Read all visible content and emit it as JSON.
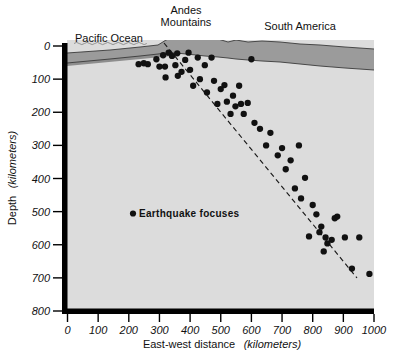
{
  "figure": {
    "title_labels": {
      "pacific_ocean": "Pacific Ocean",
      "andes_line1": "Andes",
      "andes_line2": "Mountains",
      "south_america": "South America"
    },
    "legend": {
      "marker": "earthquake-focus-dot",
      "label": "Earthquake  focuses"
    },
    "colors": {
      "mantle": "#dcdcdc",
      "crust": "#9b9b9b",
      "slab": "#8d8d8d",
      "axis": "#000000",
      "dot": "#111111",
      "page": "#ffffff"
    }
  },
  "chart_data": {
    "type": "scatter",
    "title": "",
    "xlabel_plain": "East-west distance",
    "xlabel_units": "(kilometers)",
    "ylabel_plain": "Depth",
    "ylabel_units": "(kilometers)",
    "xlim": [
      0,
      1000
    ],
    "ylim": [
      800,
      0
    ],
    "y_inverted": true,
    "grid": false,
    "legend_position": "inside-left-middle",
    "xticks": [
      0,
      100,
      200,
      300,
      400,
      500,
      600,
      700,
      800,
      900,
      1000
    ],
    "xtick_labels": [
      "0",
      "100",
      "200",
      "300",
      "400",
      "500",
      "600",
      "700",
      "800",
      "900",
      "1000"
    ],
    "yticks": [
      0,
      100,
      200,
      300,
      400,
      500,
      600,
      700,
      800
    ],
    "ytick_labels": [
      "0",
      "100",
      "200",
      "300",
      "400",
      "500",
      "600",
      "700",
      "800"
    ],
    "series": [
      {
        "name": "Earthquake focuses",
        "marker": "circle",
        "color": "#111111",
        "points": [
          [
            232,
            55
          ],
          [
            249,
            52
          ],
          [
            262,
            55
          ],
          [
            290,
            40
          ],
          [
            300,
            62
          ],
          [
            312,
            28
          ],
          [
            318,
            62
          ],
          [
            320,
            95
          ],
          [
            330,
            20
          ],
          [
            341,
            30
          ],
          [
            352,
            58
          ],
          [
            358,
            22
          ],
          [
            360,
            90
          ],
          [
            372,
            78
          ],
          [
            384,
            42
          ],
          [
            395,
            20
          ],
          [
            400,
            72
          ],
          [
            410,
            120
          ],
          [
            425,
            35
          ],
          [
            432,
            100
          ],
          [
            448,
            58
          ],
          [
            455,
            140
          ],
          [
            470,
            35
          ],
          [
            478,
            105
          ],
          [
            489,
            175
          ],
          [
            500,
            130
          ],
          [
            512,
            118
          ],
          [
            520,
            168
          ],
          [
            532,
            205
          ],
          [
            540,
            150
          ],
          [
            548,
            182
          ],
          [
            560,
            120
          ],
          [
            566,
            175
          ],
          [
            575,
            205
          ],
          [
            588,
            172
          ],
          [
            600,
            40
          ],
          [
            610,
            232
          ],
          [
            628,
            250
          ],
          [
            648,
            300
          ],
          [
            662,
            262
          ],
          [
            686,
            330
          ],
          [
            700,
            308
          ],
          [
            712,
            372
          ],
          [
            728,
            345
          ],
          [
            742,
            430
          ],
          [
            755,
            300
          ],
          [
            762,
            460
          ],
          [
            775,
            398
          ],
          [
            788,
            575
          ],
          [
            800,
            480
          ],
          [
            812,
            508
          ],
          [
            822,
            562
          ],
          [
            828,
            545
          ],
          [
            836,
            620
          ],
          [
            842,
            578
          ],
          [
            848,
            596
          ],
          [
            862,
            585
          ],
          [
            872,
            520
          ],
          [
            880,
            515
          ],
          [
            905,
            578
          ],
          [
            928,
            672
          ],
          [
            952,
            578
          ],
          [
            985,
            688
          ]
        ]
      }
    ],
    "annotations": [
      {
        "name": "benioff-zone-line",
        "style": "dashed",
        "from": [
          315,
          10
        ],
        "to": [
          945,
          718
        ]
      }
    ]
  }
}
